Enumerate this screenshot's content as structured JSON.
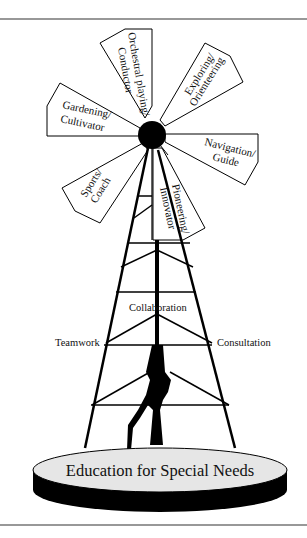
{
  "figure": {
    "base_label": "Education for Special Needs",
    "blades": [
      {
        "id": "orchestral",
        "line1": "Orchestral playing/",
        "line2": "Conductor"
      },
      {
        "id": "exploring",
        "line1": "Exploring/",
        "line2": "Orienteering"
      },
      {
        "id": "gardening",
        "line1": "Gardening/",
        "line2": "Cultivator"
      },
      {
        "id": "navigation",
        "line1": "Navigation/",
        "line2": "Guide"
      },
      {
        "id": "sports",
        "line1": "Sports/",
        "line2": "Coach"
      },
      {
        "id": "pioneering",
        "line1": "Pioneering/",
        "line2": "Innovator"
      }
    ],
    "tower_labels": {
      "top": "Collaboration",
      "left": "Teamwork",
      "right": "Consultation"
    },
    "colors": {
      "ink": "#000000",
      "platform_top": "#e6e6e6",
      "background": "#ffffff"
    }
  }
}
